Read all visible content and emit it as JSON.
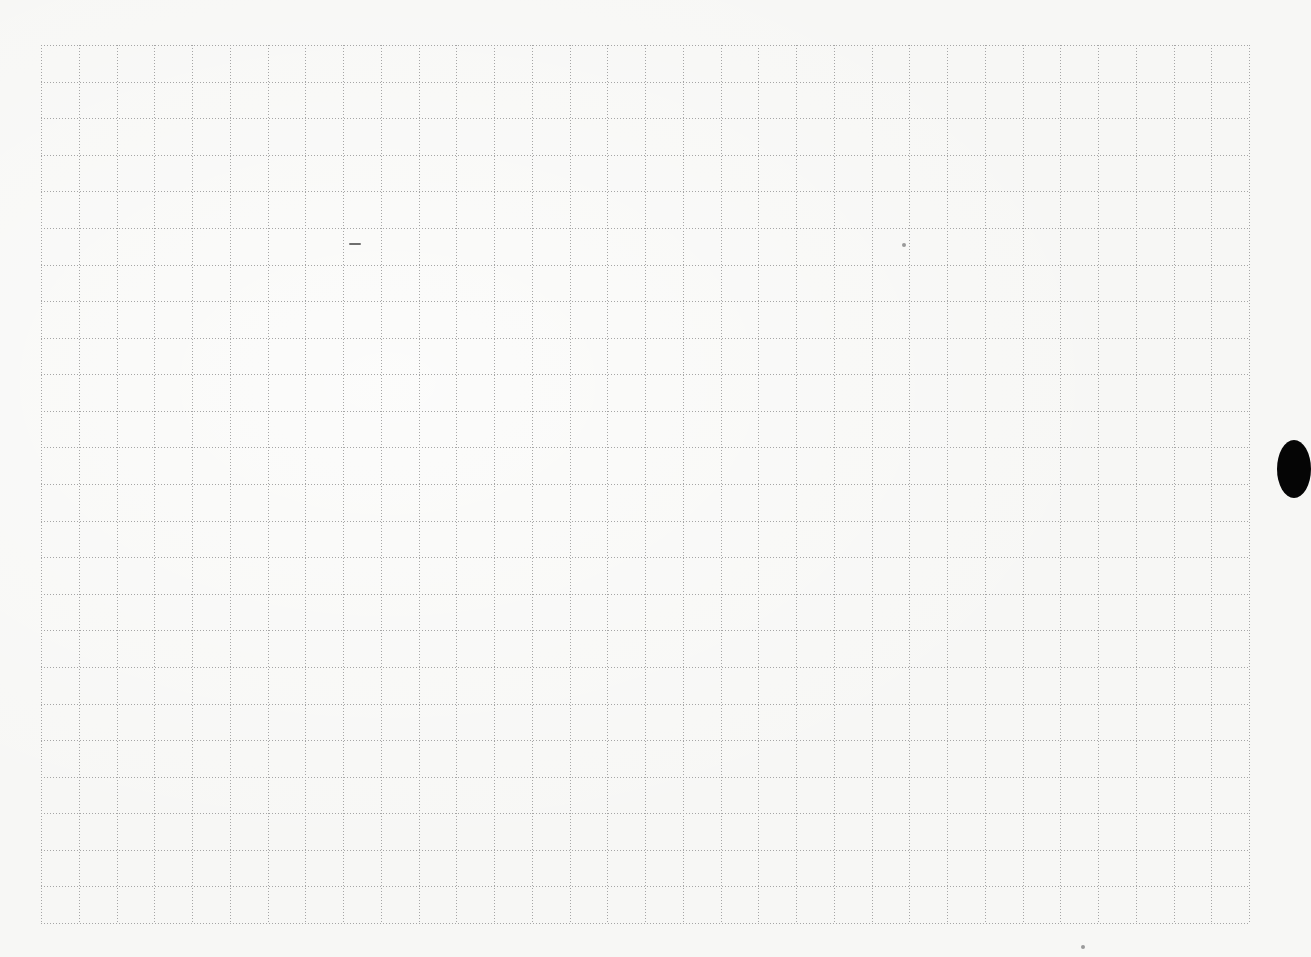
{
  "document": {
    "type": "graph paper sheet",
    "background_color": "#f7f7f5",
    "grid": {
      "columns": 32,
      "rows": 24,
      "left": 41,
      "top": 45,
      "width": 1208,
      "height": 878,
      "line_style": "dotted",
      "line_color": "#a6a6a6",
      "dot_spacing": 3
    },
    "marks": [
      {
        "kind": "pencil-mark",
        "x": 349,
        "y": 243,
        "w": 12,
        "h": 2
      },
      {
        "kind": "speck",
        "x": 904,
        "y": 245,
        "r": 2
      },
      {
        "kind": "speck",
        "x": 1083,
        "y": 947,
        "r": 2
      }
    ],
    "punch_hole": {
      "x": 1277,
      "y": 440,
      "w": 34,
      "h": 58,
      "color": "#050505"
    }
  }
}
